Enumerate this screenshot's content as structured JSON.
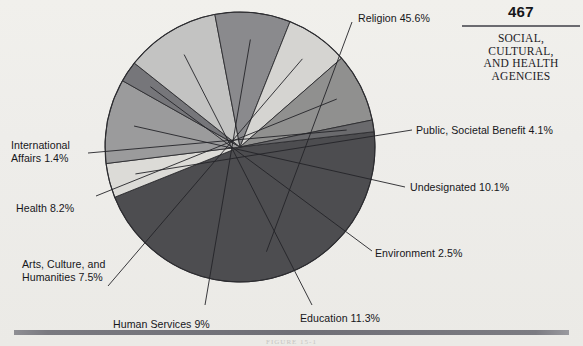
{
  "header": {
    "page_number": "467",
    "title_lines": [
      "SOCIAL,",
      "CULTURAL,",
      "AND HEALTH",
      "AGENCIES"
    ]
  },
  "figure": {
    "caption": "FIGURE 15-1"
  },
  "chart_data": {
    "type": "pie",
    "title": "",
    "xlabel": "",
    "ylabel": "",
    "legend_position": "callout-labels",
    "grid": false,
    "categories": [
      "Religion",
      "Public, Societal Benefit",
      "Undesignated",
      "Environment",
      "Education",
      "Human Services",
      "Arts, Culture, and Humanities",
      "Health",
      "International Affairs"
    ],
    "values": [
      45.6,
      4.1,
      10.1,
      2.5,
      11.3,
      9.0,
      7.5,
      8.2,
      1.4
    ],
    "unit": "%",
    "slices": [
      {
        "name": "Religion",
        "value": 45.6,
        "label": "Religion 45.6%",
        "color": "#4d4d50",
        "label_id": "label-religion",
        "label_lines": [
          "Religion 45.6%"
        ]
      },
      {
        "name": "Public, Societal Benefit",
        "value": 4.1,
        "label": "Public, Societal Benefit 4.1%",
        "color": "#dcdbd7",
        "label_id": "label-public",
        "label_lines": [
          "Public, Societal Benefit 4.1%"
        ]
      },
      {
        "name": "Undesignated",
        "value": 10.1,
        "label": "Undesignated 10.1%",
        "color": "#9b9b9c",
        "label_id": "label-undesignated",
        "label_lines": [
          "Undesignated 10.1%"
        ]
      },
      {
        "name": "Environment",
        "value": 2.5,
        "label": "Environment 2.5%",
        "color": "#76767a",
        "label_id": "label-environment",
        "label_lines": [
          "Environment 2.5%"
        ]
      },
      {
        "name": "Education",
        "value": 11.3,
        "label": "Education 11.3%",
        "color": "#c3c3c2",
        "label_id": "label-education",
        "label_lines": [
          "Education 11.3%"
        ]
      },
      {
        "name": "Human Services",
        "value": 9.0,
        "label": "Human Services 9%",
        "color": "#8a8a8d",
        "label_id": "label-human-services",
        "label_lines": [
          "Human Services 9%"
        ]
      },
      {
        "name": "Arts, Culture, and Humanities",
        "value": 7.5,
        "label": "Arts, Culture, and Humanities 7.5%",
        "color": "#d5d4d1",
        "label_id": "label-arts",
        "label_lines": [
          "Arts, Culture, and",
          "Humanities 7.5%"
        ]
      },
      {
        "name": "Health",
        "value": 8.2,
        "label": "Health 8.2%",
        "color": "#90908f",
        "label_id": "label-health",
        "label_lines": [
          "Health 8.2%"
        ]
      },
      {
        "name": "International Affairs",
        "value": 1.4,
        "label": "International Affairs 1.4%",
        "color": "#6a6a6d",
        "label_id": "label-international",
        "label_lines": [
          "International",
          "Affairs 1.4%"
        ]
      }
    ]
  }
}
